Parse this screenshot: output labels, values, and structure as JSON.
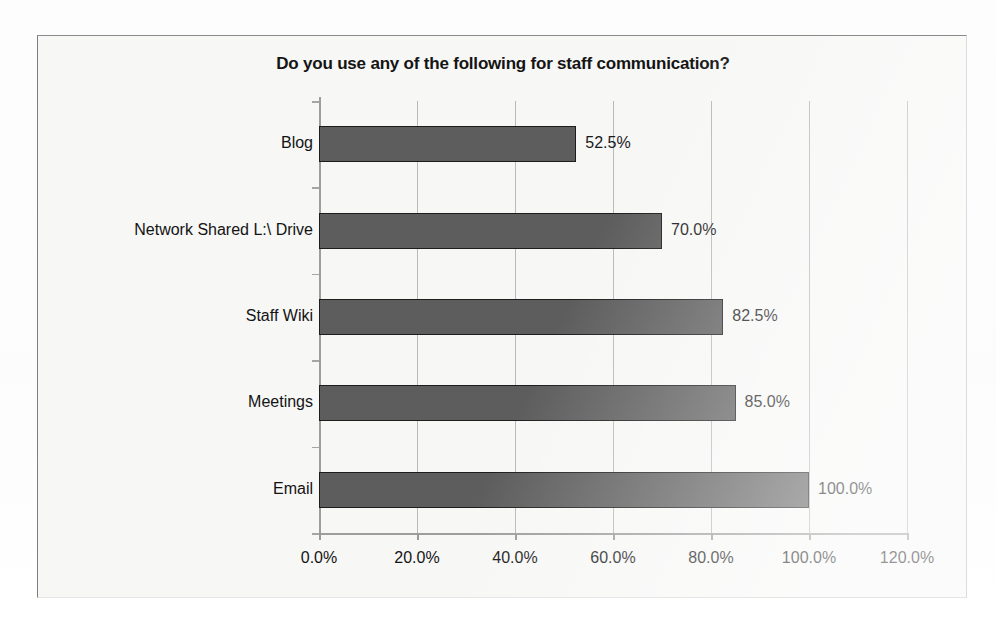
{
  "chart_data": {
    "type": "bar",
    "orientation": "horizontal",
    "title": "Do you use any of the following for staff communication?",
    "categories": [
      "Blog",
      "Network Shared L:\\ Drive",
      "Staff Wiki",
      "Meetings",
      "Email"
    ],
    "values": [
      52.5,
      70.0,
      82.5,
      85.0,
      100.0
    ],
    "data_labels": [
      "52.5%",
      "70.0%",
      "82.5%",
      "85.0%",
      "100.0%"
    ],
    "xlabel": "",
    "ylabel": "",
    "xlim": [
      0,
      120
    ],
    "xticks": [
      0,
      20,
      40,
      60,
      80,
      100,
      120
    ],
    "xtick_labels": [
      "0.0%",
      "20.0%",
      "40.0%",
      "60.0%",
      "80.0%",
      "100.0%",
      "120.0%"
    ],
    "grid": "vertical",
    "legend": "none",
    "series_name": "",
    "bar_color": "#5d5d5d",
    "bar_border_color": "#1d1d1d",
    "gridline_color": "#b9b9b9",
    "axis_color": "#9d9d9d",
    "text_color": "#141414",
    "plot_background": "#f7f7f6"
  },
  "ghost_text": {
    "a": "",
    "b": "",
    "c": ""
  }
}
